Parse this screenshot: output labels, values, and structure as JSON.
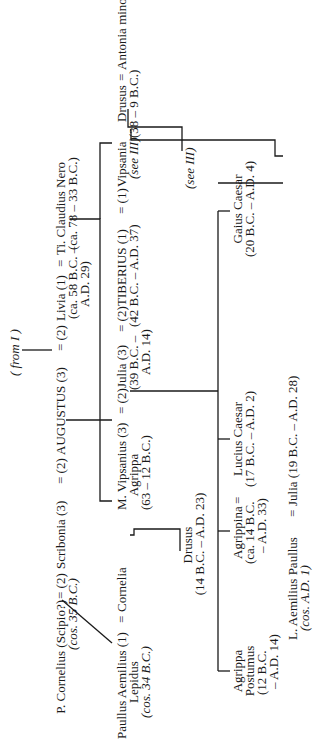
{
  "title_ref": "( from I )",
  "generation1": {
    "cornelius": {
      "name": "P. Cornelius (Scipio?)",
      "note": "(cos. 35 B.C.)"
    },
    "eq1": "= (2)",
    "scribonia": {
      "name": "Scribonia (3)"
    },
    "eq2": "= (2)",
    "augustus": {
      "name": "AUGUSTUS (3)"
    },
    "eq3": "= (2)",
    "livia": {
      "name": "Livia (1)",
      "dates": "(ca. 58 B.C. –",
      "dates2": "A.D. 29)"
    },
    "eq4": "=",
    "nero": {
      "name": "Ti. Claudius Nero",
      "dates": "(ca. 78 – 33 B.C.)"
    }
  },
  "generation2": {
    "paullus": {
      "name": "Paullus Aemilius (1)",
      "line2": "Lepidus",
      "note": "(cos. 34 B.C.)"
    },
    "eq_cornelia": "=",
    "cornelia": {
      "name": "Cornelia"
    },
    "agrippa": {
      "name": "M. Vipsanius (3)",
      "line2": "Agrippa",
      "dates": "(63 – 12 B.C.)"
    },
    "eq_julia": "= (2)",
    "julia": {
      "name": "Julia (3)",
      "dates": "(39 B.C. –",
      "dates2": "A.D. 14)"
    },
    "eq_tiberius": "= (2)",
    "tiberius": {
      "name": "TIBERIUS (1)",
      "dates": "(42 B.C. – A.D. 37)"
    },
    "eq_vipsania": "= (1)",
    "vipsania": {
      "name": "Vipsania",
      "ref": "(see III)"
    },
    "drusus_elder": {
      "name": "Drusus",
      "dates": "(38 – 9 B.C.)"
    },
    "eq_antonia": "=",
    "antonia": {
      "name": "Antonia minor"
    },
    "antonia_ref": "(see III)"
  },
  "generation3": {
    "drusus_younger": {
      "name": "Drusus",
      "dates": "(14 B.C. – A.D. 23)"
    },
    "gaius": {
      "name": "Gaius Caesar",
      "dates": "(20 B.C. – A.D. 4)"
    },
    "lucius": {
      "name": "Lucius Caesar",
      "dates": "(17 B.C. – A.D. 2)"
    },
    "agrippina": {
      "name": "Agrippina",
      "dates": "(ca. 14 B.C.",
      "dates2": "– A.D. 33)"
    },
    "eq_germanicus": "=",
    "germanicus": {
      "name": "Germanicus"
    },
    "postumus": {
      "name": "Agrippa",
      "line2": "Postumus",
      "dates": "(12 B.C.",
      "dates2": "– A.D. 14)"
    },
    "julia_younger": {
      "name": "Julia (19 B.C. – A.D. 28)"
    },
    "l_paullus": {
      "name": "L. Aemilius Paullus",
      "note": "(cos. A.D. 1)"
    },
    "eq_l_paullus": "="
  }
}
